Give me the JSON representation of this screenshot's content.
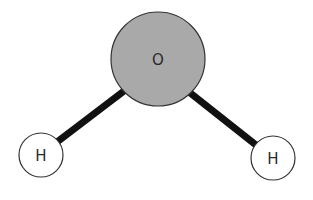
{
  "diagram": {
    "atoms": [
      {
        "id": "O",
        "label": "O",
        "cx": 158,
        "cy": 59,
        "r": 47,
        "fill": "#a9a9a9"
      },
      {
        "id": "H1",
        "label": "H",
        "cx": 41,
        "cy": 155,
        "r": 22,
        "fill": "#ffffff"
      },
      {
        "id": "H2",
        "label": "H",
        "cx": 273,
        "cy": 158,
        "r": 22,
        "fill": "#ffffff"
      }
    ],
    "bonds": [
      {
        "from": "O",
        "to": "H1"
      },
      {
        "from": "O",
        "to": "H2"
      }
    ],
    "colors": {
      "bond": "#111111",
      "outline": "#333333",
      "oxygen_fill": "#a9a9a9",
      "hydrogen_fill": "#ffffff"
    }
  }
}
